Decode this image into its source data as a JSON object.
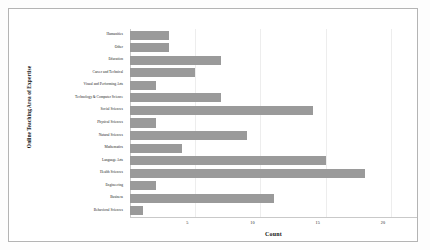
{
  "chart_data": {
    "type": "bar",
    "orientation": "horizontal",
    "title": "",
    "xlabel": "Count",
    "ylabel": "Online Teaching Area of Expertise",
    "categories": [
      "Humanities",
      "Other",
      "Education",
      "Career and Technical",
      "Visual and Performing Arts",
      "Technology & Computer Science",
      "Social Sciences",
      "Physical Sciences",
      "Natural Sciences",
      "Mathematics",
      "Language Arts",
      "Health Sciences",
      "Engineering",
      "Business",
      "Behavioral Sciences"
    ],
    "values": [
      3,
      3,
      7,
      5,
      2,
      7,
      14,
      2,
      9,
      4,
      15,
      18,
      2,
      11,
      1
    ],
    "xlim": [
      0,
      22
    ],
    "xticks": [
      5,
      10,
      15,
      20
    ],
    "xtick_labels": [
      "5",
      "10",
      "15",
      "20"
    ],
    "grid": true,
    "legend": false,
    "bar_color": "#9a9a9a",
    "background_color": "#ffffff",
    "grid_color": "#ededed",
    "axis_color": "#c9c9c9"
  }
}
